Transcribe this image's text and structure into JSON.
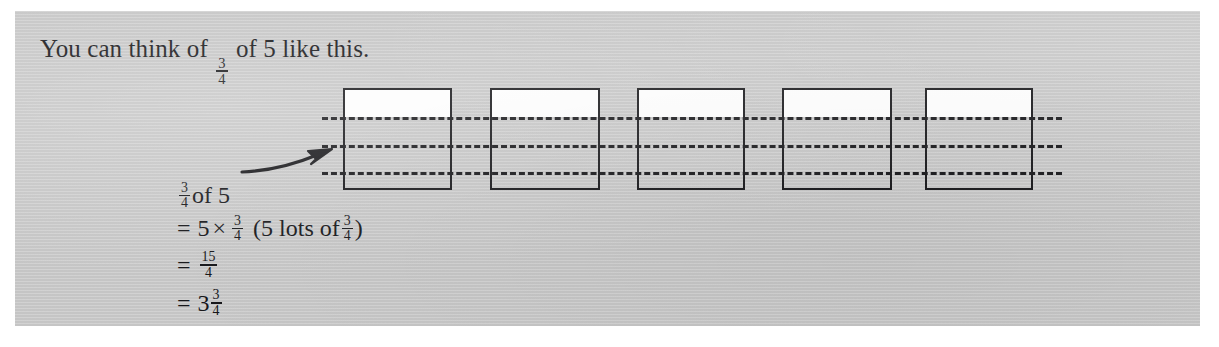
{
  "panel": {
    "background_color": "#c9c9c9",
    "ink_color": "#17171a"
  },
  "heading": {
    "prefix": "You can think of ",
    "fraction": {
      "numerator": "3",
      "denominator": "4"
    },
    "suffix": " of 5 like this."
  },
  "working": {
    "label": {
      "fraction": {
        "numerator": "3",
        "denominator": "4"
      },
      "text": " of 5"
    },
    "line2": {
      "equals": "=",
      "multiplicand": "5",
      "times": "×",
      "fraction": {
        "numerator": "3",
        "denominator": "4"
      },
      "paren_open": "(5 lots of ",
      "paren_fraction": {
        "numerator": "3",
        "denominator": "4"
      },
      "paren_close": ")"
    },
    "line3": {
      "equals": "=",
      "fraction": {
        "numerator": "15",
        "denominator": "4"
      }
    },
    "line4": {
      "equals": "=",
      "whole": "3",
      "fraction": {
        "numerator": "3",
        "denominator": "4"
      }
    }
  },
  "diagram": {
    "square_count": 5,
    "divisions_per_square": 4,
    "dashed_line_count": 3,
    "arrow": {
      "label": "arrow pointing from working to first square"
    }
  }
}
